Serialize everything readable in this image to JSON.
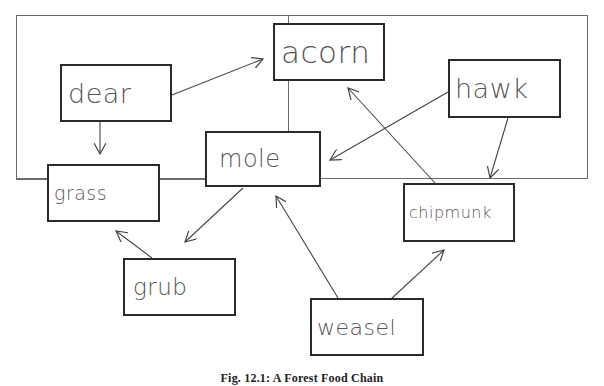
{
  "diagram": {
    "type": "food-web",
    "nodes": [
      {
        "id": "acorn",
        "label": "acorn"
      },
      {
        "id": "dear",
        "label": "dear"
      },
      {
        "id": "hawk",
        "label": "hawk"
      },
      {
        "id": "mole",
        "label": "mole"
      },
      {
        "id": "grass",
        "label": "grass"
      },
      {
        "id": "chipmunk",
        "label": "chipmunk"
      },
      {
        "id": "grub",
        "label": "grub"
      },
      {
        "id": "weasel",
        "label": "weasel"
      }
    ],
    "edges": [
      {
        "from": "dear",
        "to": "acorn"
      },
      {
        "from": "dear",
        "to": "grass"
      },
      {
        "from": "hawk",
        "to": "mole"
      },
      {
        "from": "hawk",
        "to": "chipmunk"
      },
      {
        "from": "chipmunk",
        "to": "acorn"
      },
      {
        "from": "mole",
        "to": "grub"
      },
      {
        "from": "grub",
        "to": "grass"
      },
      {
        "from": "weasel",
        "to": "mole"
      },
      {
        "from": "weasel",
        "to": "chipmunk"
      }
    ],
    "caption": "Fig. 12.1: A Forest Food Chain"
  }
}
